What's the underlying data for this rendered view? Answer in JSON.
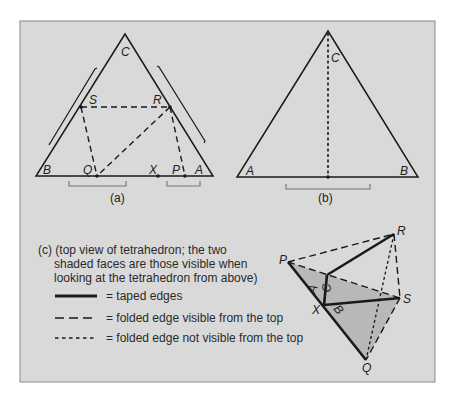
{
  "figure": {
    "background": "#d9d9d9",
    "shade": "#b8b8b8",
    "ink": "#1a1a1a",
    "bracket": "#777777"
  },
  "panel_a": {
    "caption": "(a)",
    "labels": {
      "C": "C",
      "S": "S",
      "R": "R",
      "B": "B",
      "Q": "Q",
      "X": "X",
      "P": "P",
      "A": "A"
    }
  },
  "panel_b": {
    "caption": "(b)",
    "labels": {
      "A": "A",
      "B": "B",
      "C": "C"
    }
  },
  "panel_c": {
    "caption_line1": "(c) (top view of tetrahedron; the two",
    "caption_line2": "shaded faces are those visible when",
    "caption_line3": "looking at the tetrahedron from above)",
    "legend": [
      {
        "style": "solid",
        "label": "= taped edges"
      },
      {
        "style": "dashed",
        "label": "= folded edge visible from the top"
      },
      {
        "style": "dotted",
        "label": "= folded edge not visible from the  top"
      }
    ],
    "labels": {
      "P": "P",
      "R": "R",
      "S": "S",
      "Q": "Q",
      "X": "X",
      "A": "A",
      "B": "B",
      "C": "C"
    }
  }
}
